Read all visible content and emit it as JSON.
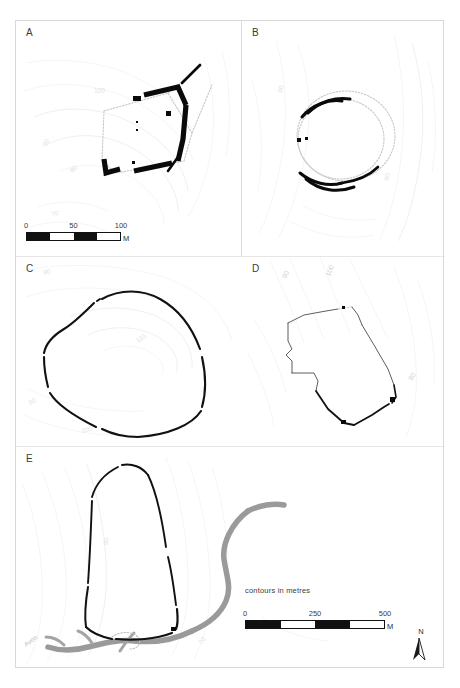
{
  "figure": {
    "panels": [
      {
        "id": "A",
        "label": "A",
        "name": "panel-a-rectangular-enclosure"
      },
      {
        "id": "B",
        "label": "B",
        "name": "panel-b-oval-enclosure"
      },
      {
        "id": "C",
        "label": "C",
        "name": "panel-c-rounded-hillfort"
      },
      {
        "id": "D",
        "label": "D",
        "name": "panel-d-polygonal-enclosure"
      },
      {
        "id": "E",
        "label": "E",
        "name": "panel-e-promontory-fort"
      }
    ]
  },
  "panel_a": {
    "letter": "A",
    "scalebar": {
      "ticks": [
        "0",
        "50",
        "100"
      ],
      "unit": "M"
    },
    "contour_labels": [
      "100",
      "90",
      "80",
      "70"
    ]
  },
  "panel_b": {
    "letter": "B",
    "contour_labels": [
      "90",
      "80"
    ]
  },
  "panel_c": {
    "letter": "C",
    "contour_labels": [
      "90",
      "100",
      "110",
      "80"
    ]
  },
  "panel_d": {
    "letter": "D",
    "contour_labels": [
      "90",
      "100",
      "80"
    ]
  },
  "panel_e": {
    "letter": "E",
    "contour_labels": [
      "90",
      "70"
    ],
    "river_label": "Avon"
  },
  "legend": {
    "caption": "contours in metres",
    "scalebar": {
      "ticks": [
        "0",
        "250",
        "500"
      ],
      "unit": "M"
    },
    "north": "N"
  }
}
